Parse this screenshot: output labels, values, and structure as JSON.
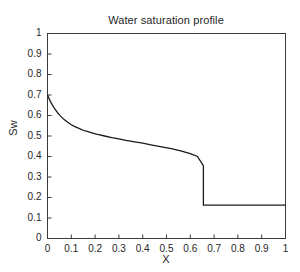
{
  "chart_data": {
    "type": "line",
    "title": "Water saturation profile",
    "xlabel": "X",
    "ylabel": "Sw",
    "xlim": [
      0,
      1
    ],
    "ylim": [
      0,
      1
    ],
    "grid": false,
    "legend": null,
    "xticks": [
      "0",
      "0.1",
      "0.2",
      "0.3",
      "0.4",
      "0.5",
      "0.6",
      "0.7",
      "0.8",
      "0.9",
      "1"
    ],
    "xtick_values": [
      0,
      0.1,
      0.2,
      0.3,
      0.4,
      0.5,
      0.6,
      0.7,
      0.8,
      0.9,
      1
    ],
    "yticks": [
      "0",
      "0.1",
      "0.2",
      "0.3",
      "0.4",
      "0.5",
      "0.6",
      "0.7",
      "0.8",
      "0.9",
      "1"
    ],
    "ytick_values": [
      0,
      0.1,
      0.2,
      0.3,
      0.4,
      0.5,
      0.6,
      0.7,
      0.8,
      0.9,
      1
    ],
    "line_color": "#1a1a1a",
    "line_width": 1.3,
    "shock_position": 0.655,
    "shock_saturation_front": 0.355,
    "residual_saturation": 0.163,
    "inlet_saturation": 0.7,
    "series": [
      {
        "name": "Sw",
        "x": [
          0.0,
          0.005,
          0.012,
          0.02,
          0.03,
          0.042,
          0.055,
          0.07,
          0.085,
          0.1,
          0.115,
          0.13,
          0.15,
          0.17,
          0.19,
          0.21,
          0.24,
          0.27,
          0.3,
          0.33,
          0.36,
          0.4,
          0.44,
          0.48,
          0.52,
          0.56,
          0.6,
          0.63,
          0.655,
          0.655,
          0.7,
          0.75,
          0.8,
          0.85,
          0.9,
          0.95,
          1.0
        ],
        "values": [
          0.7,
          0.687,
          0.669,
          0.652,
          0.633,
          0.614,
          0.597,
          0.58,
          0.567,
          0.555,
          0.546,
          0.538,
          0.528,
          0.521,
          0.514,
          0.508,
          0.5,
          0.492,
          0.486,
          0.479,
          0.473,
          0.465,
          0.456,
          0.447,
          0.438,
          0.427,
          0.414,
          0.4,
          0.355,
          0.163,
          0.163,
          0.163,
          0.163,
          0.163,
          0.163,
          0.163,
          0.163
        ]
      }
    ]
  },
  "axes": {
    "frame_color": "#3a3a3a",
    "background": "#ffffff"
  }
}
